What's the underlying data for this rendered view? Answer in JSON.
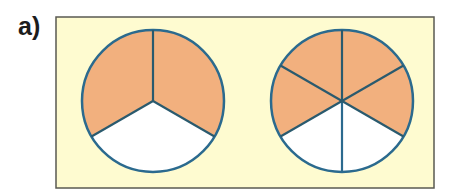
{
  "label": "a)",
  "colors": {
    "panel_bg": "#fefbd0",
    "panel_border": "#5a5a52",
    "shaded": "#f2b07e",
    "unshaded": "#ffffff",
    "outline": "#2b6a8e"
  },
  "diagrams": [
    {
      "name": "circle-thirds",
      "parts": 3,
      "shaded": 2,
      "fraction": "2/3"
    },
    {
      "name": "circle-sixths",
      "parts": 6,
      "shaded": 4,
      "fraction": "4/6"
    }
  ]
}
